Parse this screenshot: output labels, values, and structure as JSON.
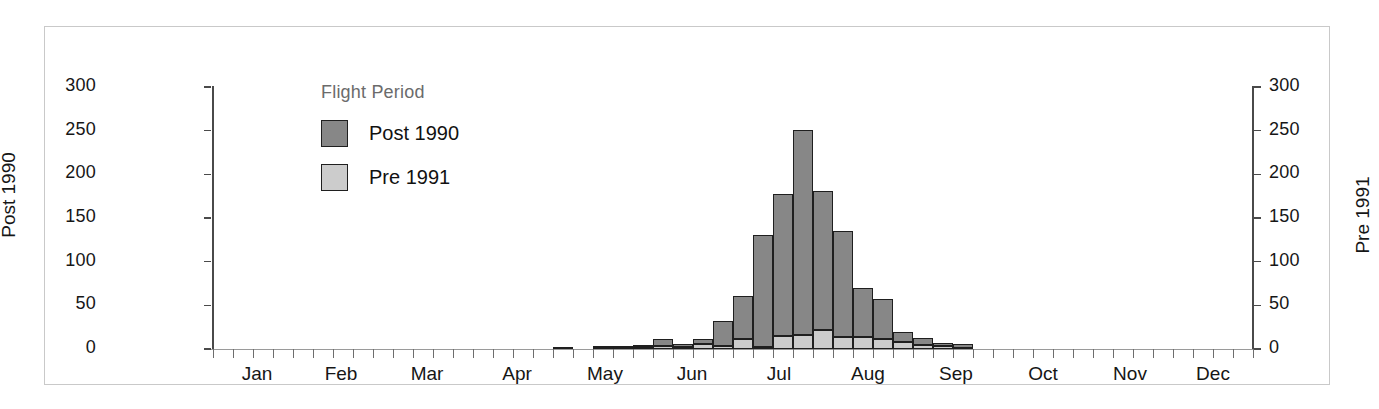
{
  "legend": {
    "title": "Flight Period",
    "entries": [
      {
        "label": "Post 1990",
        "color": "#878787",
        "icon": "square-swatch"
      },
      {
        "label": "Pre 1991",
        "color": "#cccccc",
        "icon": "square-swatch"
      }
    ]
  },
  "axes": {
    "left": {
      "title": "Post 1990",
      "ticks": [
        "0",
        "50",
        "100",
        "150",
        "200",
        "250",
        "300"
      ]
    },
    "right": {
      "title": "Pre 1991",
      "ticks": [
        "0",
        "50",
        "100",
        "150",
        "200",
        "250",
        "300"
      ]
    },
    "bottom": {
      "labels": [
        "Jan",
        "Feb",
        "Mar",
        "Apr",
        "May",
        "Jun",
        "Jul",
        "Aug",
        "Sep",
        "Oct",
        "Nov",
        "Dec"
      ]
    }
  },
  "chart_data": {
    "type": "bar",
    "title": "",
    "xlabel": "",
    "ylabel": "Post 1990",
    "y2label": "Pre 1991",
    "ylim": [
      0,
      300
    ],
    "y2lim": [
      0,
      300
    ],
    "yticks": [
      0,
      50,
      100,
      150,
      200,
      250,
      300
    ],
    "grid": false,
    "stacked": true,
    "legend_position": "inside-top-left",
    "legend_title": "Flight Period",
    "bin": "week",
    "n_bins": 52,
    "categories": [
      "W1",
      "W2",
      "W3",
      "W4",
      "W5",
      "W6",
      "W7",
      "W8",
      "W9",
      "W10",
      "W11",
      "W12",
      "W13",
      "W14",
      "W15",
      "W16",
      "W17",
      "W18",
      "W19",
      "W20",
      "W21",
      "W22",
      "W23",
      "W24",
      "W25",
      "W26",
      "W27",
      "W28",
      "W29",
      "W30",
      "W31",
      "W32",
      "W33",
      "W34",
      "W35",
      "W36",
      "W37",
      "W38",
      "W39",
      "W40",
      "W41",
      "W42",
      "W43",
      "W44",
      "W45",
      "W46",
      "W47",
      "W48",
      "W49",
      "W50",
      "W51",
      "W52"
    ],
    "month_tick_index": [
      0,
      4.4,
      8.4,
      13,
      17.4,
      21.8,
      26.1,
      30.5,
      35,
      39.3,
      43.7,
      48
    ],
    "series": [
      {
        "name": "Pre 1991",
        "color": "#cccccc",
        "values": [
          0,
          0,
          0,
          0,
          0,
          0,
          0,
          0,
          0,
          0,
          0,
          0,
          0,
          0,
          0,
          0,
          0,
          0,
          0,
          1,
          1,
          2,
          3,
          2,
          6,
          4,
          12,
          2,
          15,
          16,
          22,
          14,
          14,
          11,
          8,
          5,
          3,
          1,
          0,
          0,
          0,
          0,
          0,
          0,
          0,
          0,
          0,
          0,
          0,
          0,
          0,
          0
        ]
      },
      {
        "name": "Post 1990",
        "color": "#878787",
        "values": [
          0,
          0,
          0,
          0,
          0,
          0,
          0,
          0,
          0,
          0,
          0,
          0,
          0,
          0,
          0,
          0,
          0,
          1,
          0,
          1,
          3,
          2,
          9,
          4,
          6,
          28,
          49,
          128,
          163,
          235,
          159,
          121,
          56,
          46,
          11,
          8,
          4,
          5,
          0,
          0,
          0,
          0,
          0,
          0,
          0,
          0,
          0,
          0,
          0,
          0,
          0,
          0
        ]
      }
    ],
    "totals": [
      0,
      0,
      0,
      0,
      0,
      0,
      0,
      0,
      0,
      0,
      0,
      0,
      0,
      0,
      0,
      0,
      0,
      1,
      0,
      2,
      4,
      4,
      12,
      6,
      12,
      32,
      61,
      130,
      178,
      251,
      181,
      135,
      70,
      57,
      19,
      13,
      7,
      6,
      0,
      0,
      0,
      0,
      0,
      0,
      0,
      0,
      0,
      0,
      0,
      0,
      0,
      0
    ]
  }
}
